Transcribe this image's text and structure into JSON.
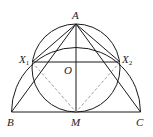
{
  "diagram": {
    "points": {
      "A": {
        "label": "A",
        "x": 76,
        "y": 24
      },
      "B": {
        "label": "B",
        "x": 11.5,
        "y": 112
      },
      "C": {
        "label": "C",
        "x": 140.5,
        "y": 112
      },
      "M": {
        "label": "M",
        "x": 76,
        "y": 112
      },
      "O": {
        "label": "O",
        "x": 76,
        "y": 62
      },
      "X1": {
        "label": "X",
        "sub": "1",
        "x": 32,
        "y": 62
      },
      "X2": {
        "label": "X",
        "sub": "2",
        "x": 120,
        "y": 62
      }
    },
    "circles": [
      {
        "name": "circle-diameter-AM",
        "cx": 76,
        "cy": 68,
        "r": 44
      }
    ],
    "arcs": [
      {
        "name": "semicircle-center-M",
        "cx": 76,
        "cy": 112,
        "r": 64.5
      }
    ],
    "solid_segments": [
      [
        "A",
        "B"
      ],
      [
        "A",
        "C"
      ],
      [
        "B",
        "C"
      ],
      [
        "A",
        "M"
      ],
      [
        "A",
        "X1"
      ],
      [
        "A",
        "X2"
      ],
      [
        "X1",
        "X2"
      ]
    ],
    "dashed_segments": [
      [
        "X1",
        "M"
      ],
      [
        "X2",
        "M"
      ]
    ],
    "colors": {
      "stroke": "#1a1a1a",
      "dashed": "#888888",
      "background": "#ffffff"
    }
  }
}
